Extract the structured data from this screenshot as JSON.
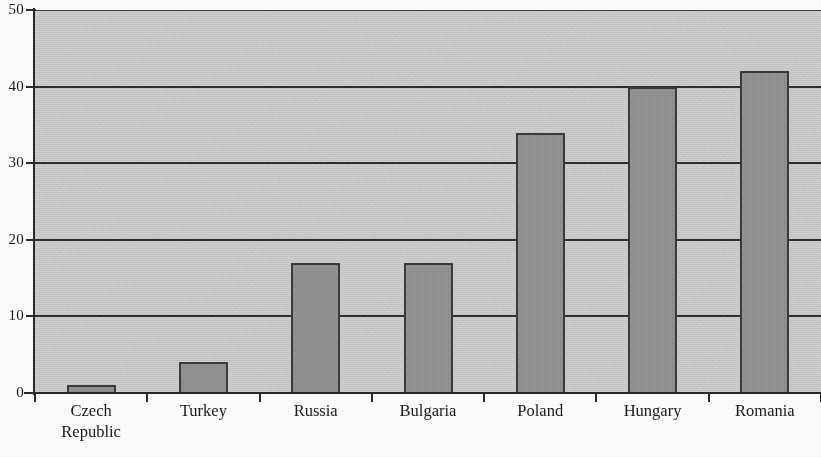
{
  "chart_data": {
    "type": "bar",
    "title": "",
    "subtitle": "",
    "xlabel": "",
    "ylabel": "",
    "categories": [
      "Czech\nRepublic",
      "Turkey",
      "Russia",
      "Bulgaria",
      "Poland",
      "Hungary",
      "Romania"
    ],
    "values": [
      1,
      4,
      17,
      17,
      34,
      40,
      42
    ],
    "series": [
      {
        "name": "",
        "values": [
          1,
          4,
          17,
          17,
          34,
          40,
          42
        ]
      }
    ],
    "ylim": [
      0,
      50
    ],
    "y_ticks": [
      0,
      10,
      20,
      30,
      40,
      50
    ],
    "y_tick_labels": [
      "0",
      "10",
      "20",
      "30",
      "40",
      "50"
    ],
    "grid": "horizontal",
    "legend": "none",
    "annotations": [],
    "colors": {
      "bar_fill": "#9a9a9a",
      "bar_edge": "#3c3c3c",
      "plot_background": "#d8d8d8",
      "gridline": "#2e2e2e",
      "axis": "#2a2a2a",
      "text": "#1a1a1a"
    }
  }
}
